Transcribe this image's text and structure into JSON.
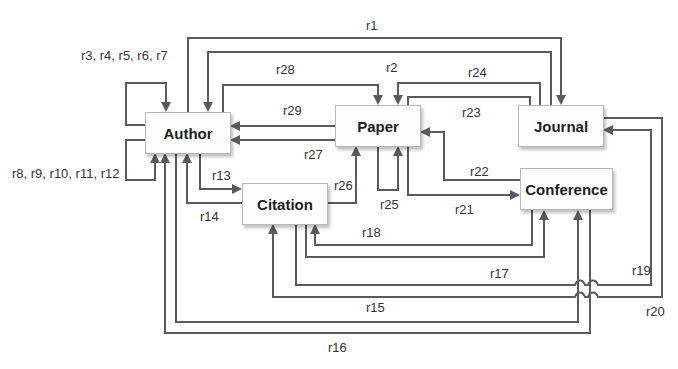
{
  "nodes": {
    "author": "Author",
    "paper": "Paper",
    "journal": "Journal",
    "conference": "Conference",
    "citation": "Citation"
  },
  "edges": {
    "r1": "r1",
    "r2": "r2",
    "r3_r7": "r3, r4, r5, r6, r7",
    "r8_r12": "r8, r9, r10, r11, r12",
    "r13": "r13",
    "r14": "r14",
    "r15": "r15",
    "r16": "r16",
    "r17": "r17",
    "r18": "r18",
    "r19": "r19",
    "r20": "r20",
    "r21": "r21",
    "r22": "r22",
    "r23": "r23",
    "r24": "r24",
    "r25": "r25",
    "r26": "r26",
    "r27": "r27",
    "r28": "r28",
    "r29": "r29"
  },
  "relations": [
    {
      "id": "r1",
      "from": "Author",
      "to": "Journal"
    },
    {
      "id": "r2",
      "from": "Journal",
      "to": "Author"
    },
    {
      "id": "r3-r7",
      "from": "Author",
      "to": "Author"
    },
    {
      "id": "r8-r12",
      "from": "Author",
      "to": "Author"
    },
    {
      "id": "r13",
      "from": "Author",
      "to": "Citation"
    },
    {
      "id": "r14",
      "from": "Citation",
      "to": "Author"
    },
    {
      "id": "r15",
      "from": "Author",
      "to": "Conference"
    },
    {
      "id": "r16",
      "from": "Conference",
      "to": "Author"
    },
    {
      "id": "r17",
      "from": "Citation",
      "to": "Conference"
    },
    {
      "id": "r18",
      "from": "Conference",
      "to": "Citation"
    },
    {
      "id": "r19",
      "from": "Citation",
      "to": "Journal"
    },
    {
      "id": "r20",
      "from": "Journal",
      "to": "Citation"
    },
    {
      "id": "r21",
      "from": "Paper",
      "to": "Conference"
    },
    {
      "id": "r22",
      "from": "Conference",
      "to": "Paper"
    },
    {
      "id": "r23",
      "from": "Paper",
      "to": "Journal"
    },
    {
      "id": "r24",
      "from": "Journal",
      "to": "Paper"
    },
    {
      "id": "r25",
      "from": "Paper",
      "to": "Paper"
    },
    {
      "id": "r26",
      "from": "Citation",
      "to": "Paper"
    },
    {
      "id": "r27",
      "from": "Paper",
      "to": "Author"
    },
    {
      "id": "r28",
      "from": "Author",
      "to": "Paper"
    },
    {
      "id": "r29",
      "from": "Paper",
      "to": "Author"
    }
  ],
  "colors": {
    "line": "#5a5a5a",
    "box_border": "#b8b8b8",
    "text": "#1e1e1e"
  }
}
